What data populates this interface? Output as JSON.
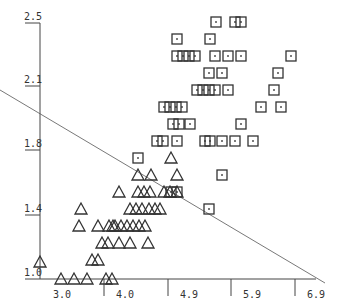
{
  "chart_data": {
    "type": "scatter",
    "title": "",
    "xlabel": "",
    "ylabel": "",
    "xlim": [
      2.4,
      6.9
    ],
    "ylim": [
      1.0,
      2.5
    ],
    "x_ticks": [
      "3.0",
      "4.0",
      "4.9",
      "5.9",
      "6.9"
    ],
    "y_ticks": [
      "1.0",
      "1.4",
      "1.8",
      "2.1",
      "2.5"
    ],
    "grid": false,
    "legend": null,
    "series": [
      {
        "name": "class-triangle",
        "marker": "triangle",
        "px_points": [
          [
            171,
            158
          ],
          [
            138,
            175
          ],
          [
            151,
            175
          ],
          [
            177,
            175
          ],
          [
            119,
            192
          ],
          [
            138,
            192
          ],
          [
            144,
            192
          ],
          [
            150,
            192
          ],
          [
            164,
            192
          ],
          [
            170,
            192
          ],
          [
            177,
            192
          ],
          [
            81,
            209
          ],
          [
            130,
            209
          ],
          [
            136,
            209
          ],
          [
            142,
            209
          ],
          [
            149,
            209
          ],
          [
            155,
            209
          ],
          [
            160,
            209
          ],
          [
            98,
            226
          ],
          [
            113,
            226
          ],
          [
            109,
            226
          ],
          [
            115,
            226
          ],
          [
            121,
            226
          ],
          [
            127,
            226
          ],
          [
            133,
            226
          ],
          [
            139,
            226
          ],
          [
            145,
            226
          ],
          [
            79,
            226
          ],
          [
            102,
            243
          ],
          [
            108,
            243
          ],
          [
            119,
            243
          ],
          [
            130,
            243
          ],
          [
            148,
            243
          ],
          [
            92,
            260
          ],
          [
            98,
            260
          ],
          [
            40,
            262
          ],
          [
            61,
            279
          ],
          [
            74,
            279
          ],
          [
            87,
            279
          ],
          [
            106,
            279
          ],
          [
            112,
            279
          ]
        ]
      },
      {
        "name": "class-square",
        "marker": "square-dot",
        "px_points": [
          [
            216,
            22
          ],
          [
            235,
            22
          ],
          [
            241,
            22
          ],
          [
            177,
            39
          ],
          [
            210,
            39
          ],
          [
            177,
            56
          ],
          [
            183,
            56
          ],
          [
            189,
            56
          ],
          [
            195,
            56
          ],
          [
            215,
            56
          ],
          [
            228,
            56
          ],
          [
            241,
            56
          ],
          [
            291,
            56
          ],
          [
            209,
            73
          ],
          [
            222,
            73
          ],
          [
            278,
            73
          ],
          [
            197,
            90
          ],
          [
            203,
            90
          ],
          [
            209,
            90
          ],
          [
            215,
            90
          ],
          [
            228,
            90
          ],
          [
            274,
            90
          ],
          [
            164,
            107
          ],
          [
            170,
            107
          ],
          [
            176,
            107
          ],
          [
            182,
            107
          ],
          [
            261,
            107
          ],
          [
            281,
            107
          ],
          [
            173,
            124
          ],
          [
            179,
            124
          ],
          [
            190,
            124
          ],
          [
            241,
            124
          ],
          [
            157,
            141
          ],
          [
            163,
            141
          ],
          [
            177,
            141
          ],
          [
            205,
            141
          ],
          [
            210,
            141
          ],
          [
            222,
            141
          ],
          [
            235,
            141
          ],
          [
            253,
            141
          ],
          [
            138,
            158
          ],
          [
            222,
            175
          ],
          [
            171,
            192
          ],
          [
            177,
            192
          ],
          [
            209,
            209
          ]
        ]
      }
    ],
    "decision_line": {
      "px_start": [
        0,
        90
      ],
      "px_end": [
        325,
        283
      ]
    }
  },
  "axes": {
    "x_tick_px": [
      null,
      104,
      168,
      231,
      295
    ],
    "x_label_px": [
      62,
      125,
      189,
      252,
      316
    ],
    "y_tick_px": [
      279,
      215,
      150,
      86,
      23
    ],
    "y_label_px_x": 32
  }
}
